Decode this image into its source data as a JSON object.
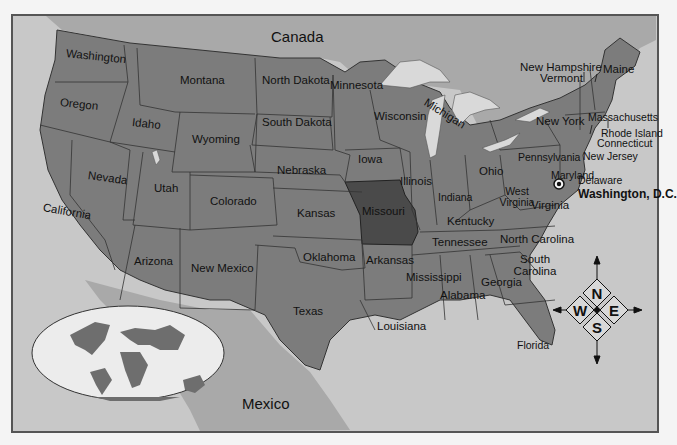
{
  "map": {
    "colors": {
      "background": "#f4f4f4",
      "frame": "#555555",
      "water": "#c8c8c8",
      "neighbor_land": "#a9a9a9",
      "us_states": "#7c7c7c",
      "highlighted_state": "#4a4a4a",
      "lakes": "#d9d9d9",
      "globe_ocean": "#ececec",
      "globe_land": "#6e6e6e"
    },
    "highlighted_state": "Missouri",
    "countries": [
      {
        "name": "Canada"
      },
      {
        "name": "Mexico"
      }
    ],
    "states": [
      {
        "name": "Washington"
      },
      {
        "name": "Oregon"
      },
      {
        "name": "California"
      },
      {
        "name": "Idaho"
      },
      {
        "name": "Nevada"
      },
      {
        "name": "Montana"
      },
      {
        "name": "Wyoming"
      },
      {
        "name": "Utah"
      },
      {
        "name": "Arizona"
      },
      {
        "name": "Colorado"
      },
      {
        "name": "New Mexico"
      },
      {
        "name": "North Dakota"
      },
      {
        "name": "South Dakota"
      },
      {
        "name": "Nebraska"
      },
      {
        "name": "Kansas"
      },
      {
        "name": "Oklahoma"
      },
      {
        "name": "Texas"
      },
      {
        "name": "Minnesota"
      },
      {
        "name": "Iowa"
      },
      {
        "name": "Missouri"
      },
      {
        "name": "Arkansas"
      },
      {
        "name": "Louisiana"
      },
      {
        "name": "Wisconsin"
      },
      {
        "name": "Illinois"
      },
      {
        "name": "Michigan"
      },
      {
        "name": "Indiana"
      },
      {
        "name": "Ohio"
      },
      {
        "name": "Kentucky"
      },
      {
        "name": "Tennessee"
      },
      {
        "name": "Mississippi"
      },
      {
        "name": "Alabama"
      },
      {
        "name": "Georgia"
      },
      {
        "name": "Florida"
      },
      {
        "name": "South Carolina"
      },
      {
        "name": "North Carolina"
      },
      {
        "name": "Virginia"
      },
      {
        "name": "West Virginia"
      },
      {
        "name": "Pennsylvania"
      },
      {
        "name": "New York"
      },
      {
        "name": "Maryland"
      },
      {
        "name": "Delaware"
      },
      {
        "name": "New Jersey"
      },
      {
        "name": "Connecticut"
      },
      {
        "name": "Rhode Island"
      },
      {
        "name": "Massachusetts"
      },
      {
        "name": "Vermont"
      },
      {
        "name": "New Hampshire"
      },
      {
        "name": "Maine"
      }
    ],
    "capital": {
      "name": "Washington, D.C.",
      "icon": "star-in-circle-icon"
    },
    "compass": {
      "north": "N",
      "south": "S",
      "east": "E",
      "west": "W"
    },
    "inset": {
      "description": "world-globe-icon"
    }
  }
}
